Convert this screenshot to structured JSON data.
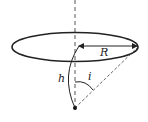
{
  "diagram": {
    "type": "geometry",
    "labels": {
      "radius": "R",
      "height": "h",
      "angle": "i"
    },
    "colors": {
      "stroke": "#222222",
      "background": "#ffffff"
    }
  }
}
